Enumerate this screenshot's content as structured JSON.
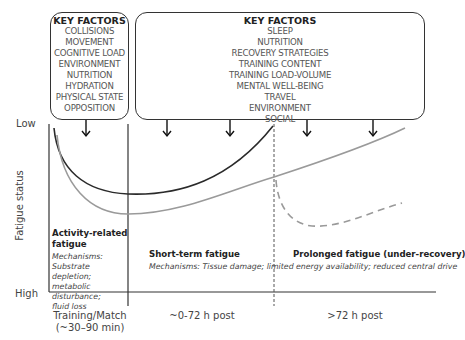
{
  "left_box": {
    "title": "KEY FACTORS",
    "items": [
      "COLLISIONS",
      "MOVEMENT",
      "COGNITIVE LOAD",
      "ENVIRONMENT",
      "NUTRITION",
      "HYDRATION",
      "PHYSICAL STATE",
      "OPPOSITION"
    ]
  },
  "right_box": {
    "title": "KEY FACTORS",
    "items": [
      "SLEEP",
      "NUTRITION",
      "RECOVERY STRATEGIES",
      "TRAINING CONTENT",
      "TRAINING LOAD-VOLUME",
      "MENTAL WELL-BEING",
      "TRAVEL",
      "ENVIRONMENT",
      "SOCIAL"
    ]
  },
  "y_axis": {
    "label": "Fatigue status",
    "top": "Low",
    "bottom": "High"
  },
  "phases": {
    "activity": {
      "title_line1": "Activity-related",
      "title_line2": "fatigue",
      "mech_lines": [
        "Mechanisms:",
        "Substrate depletion;",
        "metabolic disturbance;",
        "fluid loss"
      ]
    },
    "short_term": {
      "title": "Short-term fatigue",
      "mechanisms": "Mechanisms: Tissue damage; limited energy availability; reduced central drive"
    },
    "prolonged": {
      "title": "Prolonged fatigue (under-recovery)"
    }
  },
  "x_axis": {
    "ticks": [
      {
        "line1": "Training/Match",
        "line2": "(~30–90 min)"
      },
      {
        "line1": "~0-72 h post"
      },
      {
        "line1": ">72 h post"
      }
    ]
  },
  "colors": {
    "dark_curve": "#2a2a2a",
    "grey_curve": "#9a9a9a",
    "axis": "#333333"
  }
}
